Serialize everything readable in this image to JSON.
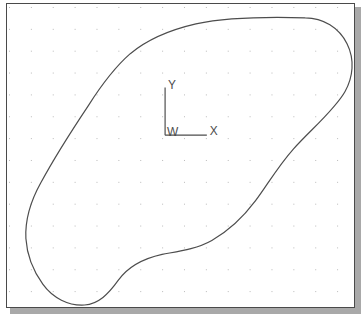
{
  "viewport": {
    "width": 363,
    "height": 316,
    "background_color": "#ffffff",
    "shadow_color": "#a9a9a9"
  },
  "drawing_area": {
    "name": "cad-drawing-canvas",
    "background_color": "#ffffff",
    "border_color": "#4a4a4a",
    "x": 6,
    "y": 3,
    "width": 349,
    "height": 305
  },
  "grid": {
    "visible": true,
    "dot_color": "#b9b9b9",
    "spacing_px": 22,
    "origin_x": 8,
    "origin_y": 6
  },
  "ucs_icon": {
    "name": "ucs-coordinate-icon",
    "origin_label": "W",
    "y_axis_label": "Y",
    "x_axis_label": "X",
    "stroke_color": "#4d4d4d",
    "corner_x": 165,
    "corner_y": 135,
    "arm_length_y": 48,
    "arm_length_x": 42
  },
  "shape": {
    "name": "closed-spline-region",
    "stroke_color": "#4d4d4d",
    "stroke_width": 1.2,
    "filled": false,
    "closed": true,
    "path": "M 300 14 C 318 14 334 24 342 40 C 350 56 348 74 340 88 C 330 106 306 126 288 146 C 272 164 262 182 250 198 C 238 214 224 228 206 238 C 190 247 172 249 156 252 C 138 256 122 264 112 278 C 102 292 92 302 78 303 C 62 304 46 296 36 282 C 26 268 20 252 19 236 C 18 216 24 198 34 180 C 48 154 66 126 82 102 C 96 80 108 64 124 50 C 142 35 164 26 190 20 C 224 13 268 13 300 14 Z"
  }
}
